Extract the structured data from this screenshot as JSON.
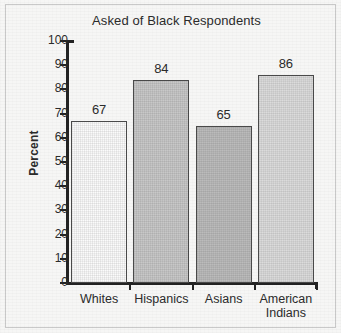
{
  "chart_data": {
    "type": "bar",
    "title": "Asked of Black Respondents",
    "xlabel": "",
    "ylabel": "Percent",
    "categories": [
      "Whites",
      "Hispanics",
      "Asians",
      "American Indians"
    ],
    "category_lines": [
      [
        "Whites"
      ],
      [
        "Hispanics"
      ],
      [
        "Asians"
      ],
      [
        "American",
        "Indians"
      ]
    ],
    "values": [
      67,
      84,
      65,
      86
    ],
    "value_labels": [
      "67",
      "84",
      "65",
      "86"
    ],
    "ylim": [
      0,
      100
    ],
    "ytick_values": [
      100,
      90,
      80,
      70,
      60,
      50,
      40,
      30,
      20,
      10,
      0
    ],
    "ytick_labels": [
      "100",
      "90",
      "80",
      "70",
      "60",
      "50",
      "40",
      "30",
      "20",
      "10",
      "0"
    ],
    "grid": false,
    "legend": false,
    "bar_colors": [
      "#fbfbfb",
      "#c8c8c8",
      "#bcbcbc",
      "#dcdcdc"
    ],
    "bar_border_color": "#4a4a4a",
    "axis_color": "#232323",
    "background_color": "#f6f6f5",
    "frame_color": "#c9c9c9",
    "text_color": "#2b2b2b"
  }
}
